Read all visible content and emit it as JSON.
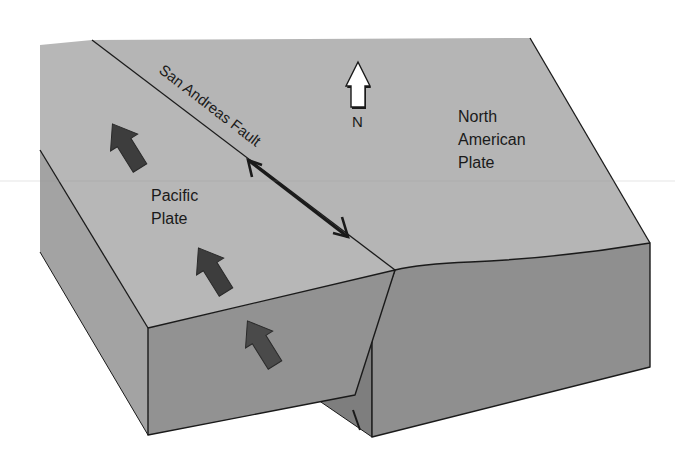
{
  "diagram": {
    "title": "",
    "labels": {
      "fault": "San Andreas Fault",
      "north": "N",
      "north_american_line1": "North",
      "north_american_line2": "American",
      "north_american_line3": "Plate",
      "pacific_line1": "Pacific",
      "pacific_line2": "Plate"
    },
    "colors": {
      "top_surface": "#b5b5b5",
      "front_face": "#8f8f8f",
      "side_face": "#a3a3a3",
      "notch_face": "#7e7e7e",
      "motion_arrow": "#3d3d3d",
      "outline": "#1a1a1a",
      "north_arrow_fill": "#ffffff"
    },
    "plates": [
      {
        "name": "Pacific Plate",
        "motion": "northwest"
      },
      {
        "name": "North American Plate",
        "motion": "relative southeast"
      }
    ]
  }
}
